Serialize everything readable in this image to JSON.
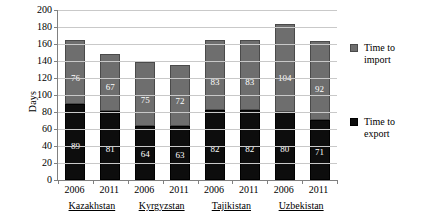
{
  "chart_data": {
    "type": "bar",
    "subtype": "stacked-vertical",
    "title": "",
    "xlabel": "",
    "ylabel": "Days",
    "ylim": [
      0,
      200
    ],
    "ytick_step": 20,
    "yticks": [
      200,
      180,
      160,
      140,
      120,
      100,
      80,
      60,
      40,
      20,
      0
    ],
    "grid": true,
    "legend_position": "right",
    "categories": [
      "2006",
      "2011",
      "2006",
      "2011",
      "2006",
      "2011",
      "2006",
      "2011"
    ],
    "groups": [
      {
        "name": "Kazakhstan",
        "years": [
          "2006",
          "2011"
        ]
      },
      {
        "name": "Kyrgyzstan",
        "years": [
          "2006",
          "2011"
        ]
      },
      {
        "name": "Tajikistan",
        "years": [
          "2006",
          "2011"
        ]
      },
      {
        "name": "Uzbekistan",
        "years": [
          "2006",
          "2011"
        ]
      }
    ],
    "series": [
      {
        "name": "Time to export",
        "color": "#0d0d0d",
        "values": [
          89,
          81,
          64,
          63,
          82,
          82,
          80,
          71
        ]
      },
      {
        "name": "Time to import",
        "color": "#6e6e6e",
        "values": [
          76,
          67,
          75,
          72,
          83,
          83,
          104,
          92
        ]
      }
    ],
    "totals": [
      165,
      148,
      139,
      135,
      165,
      165,
      184,
      163
    ],
    "bars": [
      {
        "group": "Kazakhstan",
        "year": "2006",
        "export": 89,
        "import": 76,
        "total": 165
      },
      {
        "group": "Kazakhstan",
        "year": "2011",
        "export": 81,
        "import": 67,
        "total": 148
      },
      {
        "group": "Kyrgyzstan",
        "year": "2006",
        "export": 64,
        "import": 75,
        "total": 139
      },
      {
        "group": "Kyrgyzstan",
        "year": "2011",
        "export": 63,
        "import": 72,
        "total": 135
      },
      {
        "group": "Tajikistan",
        "year": "2006",
        "export": 82,
        "import": 83,
        "total": 165
      },
      {
        "group": "Tajikistan",
        "year": "2011",
        "export": 82,
        "import": 83,
        "total": 165
      },
      {
        "group": "Uzbekistan",
        "year": "2006",
        "export": 80,
        "import": 104,
        "total": 184
      },
      {
        "group": "Uzbekistan",
        "year": "2011",
        "export": 71,
        "import": 92,
        "total": 163
      }
    ]
  },
  "axis": {
    "y_title": "Days",
    "y_tick_labels": [
      "200",
      "180",
      "160",
      "140",
      "120",
      "100",
      "80",
      "60",
      "40",
      "20",
      "0"
    ],
    "x_tick_labels": [
      "2006",
      "2011",
      "2006",
      "2011",
      "2006",
      "2011",
      "2006",
      "2011"
    ],
    "group_labels": [
      "Kazakhstan",
      "Kyrgyzstan",
      "Tajikistan",
      "Uzbekistan"
    ]
  },
  "legend": {
    "items": [
      {
        "label_line1": "Time to",
        "label_line2": "import",
        "color": "#6e6e6e"
      },
      {
        "label_line1": "Time to",
        "label_line2": "export",
        "color": "#0d0d0d"
      }
    ]
  },
  "data_labels": {
    "import": [
      "76",
      "67",
      "75",
      "72",
      "83",
      "83",
      "104",
      "92"
    ],
    "export": [
      "89",
      "81",
      "64",
      "63",
      "82",
      "82",
      "80",
      "71"
    ]
  }
}
